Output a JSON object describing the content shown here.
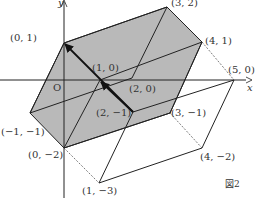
{
  "figure_label": "図2",
  "axes": {
    "x_label": "x",
    "y_label": "y",
    "origin_label": "O"
  },
  "colors": {
    "shade": "#b9b9b9",
    "line": "#222222"
  },
  "points": [
    {
      "label": "(0, 1)",
      "px": [
        64,
        43
      ],
      "lx": 10,
      "ly": 33
    },
    {
      "label": "(3, 2)",
      "px": [
        167,
        7
      ],
      "lx": 171,
      "ly": 0
    },
    {
      "label": "(4, 1)",
      "px": [
        202,
        42
      ],
      "lx": 205,
      "ly": 36
    },
    {
      "label": "(5, 0)",
      "px": [
        234,
        80
      ],
      "lx": 230,
      "ly": 68
    },
    {
      "label": "(1, 0)",
      "px": [
        100,
        80
      ],
      "lx": 92,
      "ly": 64
    },
    {
      "label": "(2, 0)",
      "px": [
        132,
        76
      ],
      "lx": 130,
      "ly": 84
    },
    {
      "label": "(2, −1)",
      "px": [
        133,
        112
      ],
      "lx": 97,
      "ly": 108
    },
    {
      "label": "(3, −1)",
      "px": [
        170,
        113
      ],
      "lx": 172,
      "ly": 108
    },
    {
      "label": "(−1, −1)",
      "px": [
        30,
        113
      ],
      "lx": 1,
      "ly": 127
    },
    {
      "label": "(0, −2)",
      "px": [
        64,
        148
      ],
      "lx": 29,
      "ly": 150
    },
    {
      "label": "(4, −2)",
      "px": [
        202,
        148
      ],
      "lx": 200,
      "ly": 152
    },
    {
      "label": "(1, −3)",
      "px": [
        99,
        183
      ],
      "lx": 82,
      "ly": 186
    }
  ]
}
